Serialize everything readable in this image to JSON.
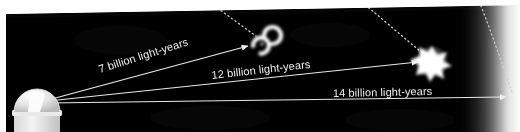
{
  "figure": {
    "background_color": "#ffffff",
    "sky_color": "#000000",
    "line_color": "#e8e8e8",
    "label_color": "#efefef",
    "dotted_color": "#cfcfcf"
  },
  "objects": [
    {
      "id": "observatory",
      "name": "observatory-dome",
      "label": "",
      "x": 30,
      "y": 100
    },
    {
      "id": "galaxy",
      "name": "spiral-galaxy",
      "label": "",
      "x": 262,
      "y": 44
    },
    {
      "id": "quasar",
      "name": "bright-starburst-object",
      "label": "",
      "x": 432,
      "y": 62
    },
    {
      "id": "horizon",
      "name": "cosmic-horizon-glow",
      "label": "",
      "x": 513,
      "y": 97
    }
  ],
  "sightlines": [
    {
      "id": "line-7",
      "label": "7 billion light-years",
      "from": "observatory",
      "to": "galaxy",
      "distance_value": 7,
      "distance_units": "billion light-years",
      "label_x": 100,
      "label_y": 73,
      "label_rotation": -17.5
    },
    {
      "id": "line-12",
      "label": "12 billion light-years",
      "from": "observatory",
      "to": "quasar",
      "distance_value": 12,
      "distance_units": "billion light-years",
      "label_x": 212,
      "label_y": 79,
      "label_rotation": -6.5
    },
    {
      "id": "line-14",
      "label": "14 billion light-years",
      "from": "observatory",
      "to": "horizon",
      "distance_value": 14,
      "distance_units": "billion light-years",
      "label_x": 333,
      "label_y": 97,
      "label_rotation": -1.2
    }
  ],
  "dotted_guides": [
    {
      "id": "guide-galaxy",
      "name": "dotted-guide-to-galaxy",
      "to": "galaxy"
    },
    {
      "id": "guide-quasar",
      "name": "dotted-guide-to-quasar",
      "to": "quasar"
    },
    {
      "id": "guide-horizon",
      "name": "dotted-guide-to-horizon",
      "to": "horizon"
    }
  ]
}
